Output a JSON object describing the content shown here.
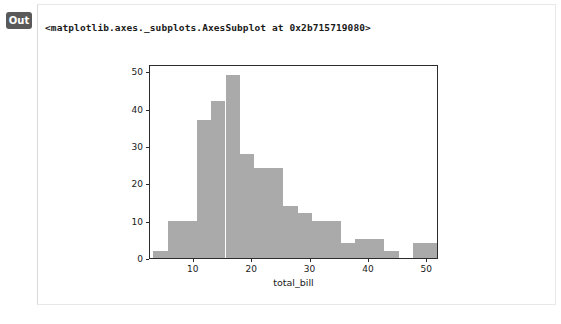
{
  "cell": {
    "prompt_label": "Out",
    "repr_text": "<matplotlib.axes._subplots.AxesSubplot at 0x2b715719080>"
  },
  "colors": {
    "bar_fill": "#aaaaaa",
    "axes_line": "#2b2b2b",
    "panel_border": "#e8e8e8",
    "badge_bg": "#595959",
    "badge_text": "#ffffff",
    "text": "#1a1a1a",
    "background": "#ffffff"
  },
  "chart_data": {
    "type": "bar",
    "title": "",
    "xlabel": "total_bill",
    "ylabel": "",
    "xlim": [
      2.5,
      52.0
    ],
    "ylim": [
      0,
      52
    ],
    "grid": false,
    "legend": null,
    "bin_width": 2.4725,
    "bin_edges": [
      3.07,
      5.5425,
      8.015,
      10.4875,
      12.96,
      15.4325,
      17.905,
      20.3775,
      22.85,
      25.3225,
      27.795,
      30.2675,
      32.74,
      35.2125,
      37.685,
      40.1575,
      42.63,
      45.1025,
      47.575,
      50.0475,
      52.52
    ],
    "values": [
      2,
      10,
      10,
      37,
      42,
      49,
      28,
      24,
      24,
      14,
      12,
      10,
      10,
      4,
      5,
      5,
      2,
      0,
      4,
      4
    ],
    "categories": [
      "3.1",
      "5.5",
      "8.0",
      "10.5",
      "13.0",
      "15.4",
      "17.9",
      "20.4",
      "22.9",
      "25.3",
      "27.8",
      "30.3",
      "32.7",
      "35.2",
      "37.7",
      "40.2",
      "42.6",
      "45.1",
      "47.6",
      "50.0"
    ],
    "xticks": [
      10,
      20,
      30,
      40,
      50
    ],
    "xticklabels": [
      "10",
      "20",
      "30",
      "40",
      "50"
    ],
    "yticks": [
      0,
      10,
      20,
      30,
      40,
      50
    ],
    "yticklabels": [
      "0",
      "10",
      "20",
      "30",
      "40",
      "50"
    ]
  }
}
